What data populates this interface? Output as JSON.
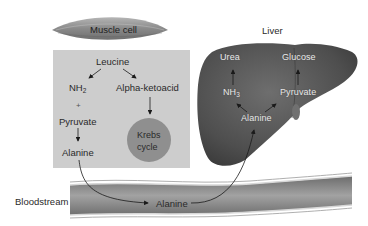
{
  "muscle_cell": {
    "label": "Muscle cell",
    "leucine": "Leucine",
    "nh2": "NH",
    "nh2_sub": "2",
    "plus": "+",
    "pyruvate": "Pyruvate",
    "alanine": "Alanine",
    "alpha_ketoacid": "Alpha-ketoacid",
    "krebs_line1": "Krebs",
    "krebs_line2": "cycle"
  },
  "liver": {
    "title": "Liver",
    "urea": "Urea",
    "glucose": "Glucose",
    "nh2": "NH",
    "nh2_sub": "3",
    "pyruvate": "Pyruvate",
    "alanine": "Alanine"
  },
  "bloodstream": {
    "label": "Bloodstream",
    "alanine": "Alanine"
  },
  "colors": {
    "box_bg": "#cdcdcd",
    "krebs_circle": "#8f8f8f",
    "liver": "#5a5a5a",
    "vessel": "#8c8c8c"
  }
}
